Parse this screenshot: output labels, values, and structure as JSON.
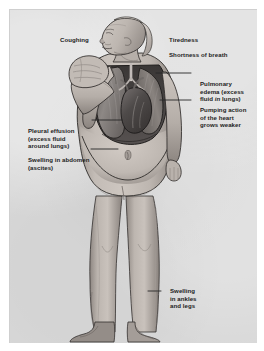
{
  "figure": {
    "panel": {
      "background_color": "#d9d9d9",
      "matte_color": "#ffffff",
      "border_color": "#cfcfcf"
    }
  },
  "labels": {
    "coughing": "Coughing",
    "tiredness": "Tiredness",
    "shortness_of_breath": "Shortness of breath",
    "pulmonary_edema_line1": "Pulmonary",
    "pulmonary_edema_line2": "edema (excess",
    "pulmonary_edema_line3_pre": "fluid ",
    "pulmonary_edema_line3_em": "in",
    "pulmonary_edema_line3_post": " lungs)",
    "pumping_action": "Pumping action\nof the heart\ngrows weaker",
    "pleural_effusion": "Pleural effusion\n(excess fluid\naround lungs)",
    "swelling_abdomen": "Swelling in abdomen\n(ascites)",
    "swelling_ankles": "Swelling\nin ankles\nand legs"
  },
  "anatomy": {
    "left_lung": "left-lung",
    "right_lung": "right-lung",
    "heart": "heart",
    "trachea": "trachea-and-bronchi",
    "abdomen": "distended-abdomen-ascites",
    "navel": "navel",
    "raised_hand": "raised-hand-covering-mouth",
    "head": "head-profile-facing-left",
    "legs": "swollen-legs",
    "ankles": "swollen-ankles",
    "feet": "feet"
  },
  "colors": {
    "skin_light": "#cfc8c2",
    "skin_mid": "#b2aaa4",
    "skin_shadow": "#8d8781",
    "lung_fill": "#7e7a78",
    "heart_fill": "#5e5a58",
    "outline": "#2b2b2b",
    "text": "#1d1d1d",
    "leader_line": "#262626"
  }
}
